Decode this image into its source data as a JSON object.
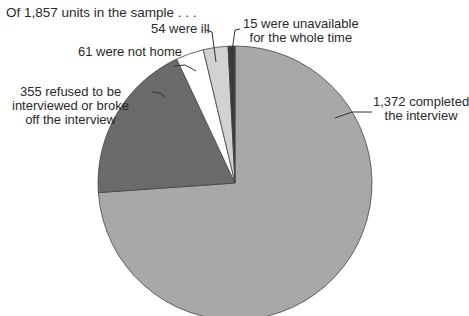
{
  "chart_data": {
    "type": "pie",
    "title": "Of 1,857 units in the sample . . .",
    "total": 1857,
    "start_angle_deg": 0,
    "direction": "clockwise",
    "slices": [
      {
        "name": "completed",
        "value": 1372,
        "label_line1": "1,372 completed",
        "label_line2": "the interview",
        "color": "#a8a8a8"
      },
      {
        "name": "refused",
        "value": 355,
        "label_line1": "355 refused to be",
        "label_line2": "interviewed or broke",
        "label_line3": "off the interview",
        "color": "#6a6a6a"
      },
      {
        "name": "not-home",
        "value": 61,
        "label_line1": "61 were not home",
        "color": "#ffffff"
      },
      {
        "name": "ill",
        "value": 54,
        "label_line1": "54 were ill",
        "color": "#d2d2d2"
      },
      {
        "name": "unavailable",
        "value": 15,
        "label_line1": "15 were unavailable",
        "label_line2": "for the whole time",
        "color": "#3a3a3a"
      }
    ],
    "legend": "none (direct labels with leader lines)"
  }
}
